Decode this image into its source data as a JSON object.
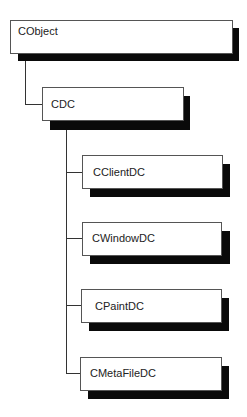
{
  "diagram": {
    "type": "class-hierarchy",
    "nodes": [
      {
        "id": "cobject",
        "label": "CObject"
      },
      {
        "id": "cdc",
        "label": "CDC"
      },
      {
        "id": "cclientdc",
        "label": "CClientDC"
      },
      {
        "id": "cwindowdc",
        "label": "CWindowDC"
      },
      {
        "id": "cpaintdc",
        "label": "CPaintDC"
      },
      {
        "id": "cmetafiledc",
        "label": "CMetaFileDC"
      }
    ],
    "edges": [
      {
        "from": "cobject",
        "to": "cdc"
      },
      {
        "from": "cdc",
        "to": "cclientdc"
      },
      {
        "from": "cdc",
        "to": "cwindowdc"
      },
      {
        "from": "cdc",
        "to": "cpaintdc"
      },
      {
        "from": "cdc",
        "to": "cmetafiledc"
      }
    ],
    "colors": {
      "box_fill": "#ffffff",
      "box_border": "#555555",
      "shadow": "#0a0a0a",
      "line": "#333333"
    }
  }
}
